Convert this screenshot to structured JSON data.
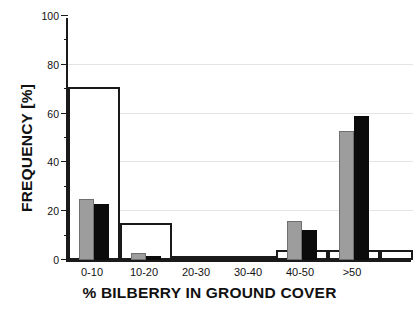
{
  "chart_data": {
    "type": "bar",
    "title": "",
    "xlabel": "% BILBERRY IN GROUND COVER",
    "ylabel": "FREQUENCY [%]",
    "categories": [
      "0-10",
      "10-20",
      "20-30",
      "30-40",
      "40-50",
      ">50"
    ],
    "ylim": [
      0,
      100
    ],
    "xlim_note": "categorical, 6 bins plus a narrow trailing outline segment past >50",
    "yticks": [
      0,
      20,
      40,
      60,
      80,
      100
    ],
    "ytick_labels": [
      "0",
      "20",
      "40",
      "60",
      "80",
      "100"
    ],
    "yminor_ticks": [
      10,
      30,
      50,
      70,
      90
    ],
    "grid": "horizontal gridlines at 20, 40, 60, 80",
    "legend": "none",
    "series": [
      {
        "name": "white-outline",
        "style": "open/white bars with black outline, full bin width",
        "color": "#ffffff",
        "edge_color": "#1a1a1a",
        "values": [
          71,
          15,
          0.5,
          0.5,
          4,
          4
        ]
      },
      {
        "name": "gray",
        "style": "solid gray bars, narrow",
        "color": "#9d9d9d",
        "values": [
          25,
          3,
          0,
          0,
          16,
          53
        ]
      },
      {
        "name": "black",
        "style": "solid black bars, narrow",
        "color": "#0b0b0b",
        "values": [
          23,
          1.5,
          0,
          0,
          12.5,
          59
        ]
      }
    ]
  },
  "axes": {
    "y_title": "FREQUENCY [%]",
    "x_title": "% BILBERRY IN GROUND COVER"
  }
}
